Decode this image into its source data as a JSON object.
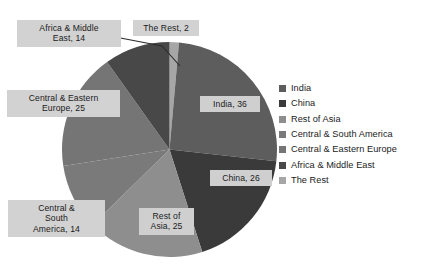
{
  "chart_data": {
    "type": "pie",
    "title": "",
    "subtitle": "",
    "xlabel": "",
    "ylabel": "",
    "grid": false,
    "legend_position": "right",
    "start_angle_deg": 0,
    "direction": "clockwise",
    "total": 142,
    "categories": [
      "India",
      "China",
      "Rest of Asia",
      "Central & South America",
      "Central & Eastern Europe",
      "Africa & Middle East",
      "The Rest"
    ],
    "values": [
      36,
      26,
      25,
      14,
      25,
      14,
      2
    ],
    "colors": [
      "#5d5d5d",
      "#3a3a3a",
      "#8e8e8e",
      "#7a7a7a",
      "#757575",
      "#484848",
      "#a6a6a6"
    ],
    "slice_order_clockwise_from_12": [
      "The Rest",
      "India",
      "China",
      "Rest of Asia",
      "Central & South America",
      "Central & Eastern Europe",
      "Africa & Middle East"
    ],
    "data_labels": [
      "India, 36",
      "China, 26",
      "Rest of\nAsia, 25",
      "Central &\nSouth\nAmerica, 14",
      "Central & Eastern\nEurope, 25",
      "Africa & Middle\nEast, 14",
      "The Rest, 2"
    ]
  },
  "labels": {
    "india": "India, 36",
    "china": "China, 26",
    "rest_of_asia": "Rest of\nAsia, 25",
    "central_south_america": "Central &\nSouth\nAmerica, 14",
    "central_eastern_europe": "Central & Eastern\nEurope, 25",
    "africa_middle_east": "Africa & Middle\nEast, 14",
    "the_rest": "The Rest, 2"
  },
  "legend": {
    "items": [
      {
        "label": "India",
        "color": "#5d5d5d"
      },
      {
        "label": "China",
        "color": "#3a3a3a"
      },
      {
        "label": "Rest of Asia",
        "color": "#8e8e8e"
      },
      {
        "label": "Central & South America",
        "color": "#7a7a7a"
      },
      {
        "label": "Central & Eastern Europe",
        "color": "#757575"
      },
      {
        "label": "Africa & Middle East",
        "color": "#484848"
      },
      {
        "label": "The Rest",
        "color": "#a6a6a6"
      }
    ]
  }
}
